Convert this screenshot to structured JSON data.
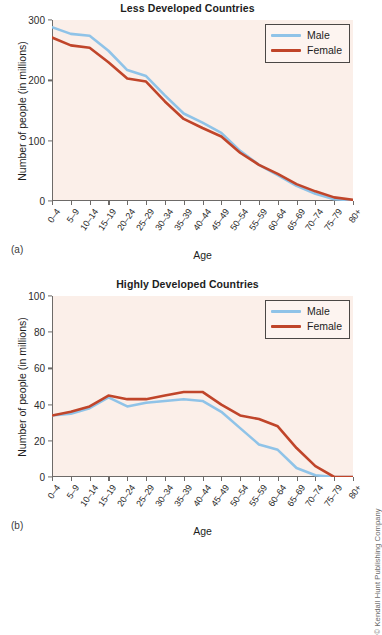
{
  "figures": [
    {
      "panel_label": "(a)",
      "title": "Less Developed Countries",
      "ylabel": "Number of people (in millions)",
      "xlabel": "Age",
      "legend": [
        {
          "label": "Male",
          "color": "#8fc3e8"
        },
        {
          "label": "Female",
          "color": "#c0452a"
        }
      ]
    },
    {
      "panel_label": "(b)",
      "title": "Highly Developed Countries",
      "ylabel": "Number of people (in millions)",
      "xlabel": "Age",
      "legend": [
        {
          "label": "Male",
          "color": "#8fc3e8"
        },
        {
          "label": "Female",
          "color": "#c0452a"
        }
      ]
    }
  ],
  "copyright": "© Kendall Hunt Publishing Company",
  "colors": {
    "male": "#8fc3e8",
    "female": "#c0452a",
    "plot_background": "#fbefe9",
    "axis": "#6d6a68",
    "page_background": "#ffffff"
  },
  "chart_data": [
    {
      "type": "line",
      "title": "Less Developed Countries",
      "panel": "(a)",
      "xlabel": "Age",
      "ylabel": "Number of people (in millions)",
      "categories": [
        "0-4",
        "5-9",
        "10-14",
        "15-19",
        "20-24",
        "25-29",
        "30-34",
        "35-39",
        "40-44",
        "45-49",
        "50-54",
        "55-59",
        "60-64",
        "65-69",
        "70-74",
        "75-79",
        "80+"
      ],
      "ylim": [
        0,
        300
      ],
      "yticks": [
        0,
        100,
        200,
        300
      ],
      "grid": false,
      "legend_position": "top-right",
      "series": [
        {
          "name": "Male",
          "color": "#8fc3e8",
          "values": [
            288,
            277,
            274,
            249,
            217,
            207,
            175,
            145,
            130,
            113,
            83,
            60,
            43,
            25,
            12,
            3,
            1
          ]
        },
        {
          "name": "Female",
          "color": "#c0452a",
          "values": [
            271,
            258,
            254,
            230,
            203,
            198,
            165,
            136,
            121,
            107,
            80,
            60,
            45,
            28,
            16,
            6,
            2
          ]
        }
      ]
    },
    {
      "type": "line",
      "title": "Highly Developed Countries",
      "panel": "(b)",
      "xlabel": "Age",
      "ylabel": "Number of people (in millions)",
      "categories": [
        "0-4",
        "5-9",
        "10-14",
        "15-19",
        "20-24",
        "25-29",
        "30-34",
        "35-39",
        "40-44",
        "45-49",
        "50-54",
        "55-59",
        "60-64",
        "65-69",
        "70-74",
        "75-79",
        "80+"
      ],
      "ylim": [
        0,
        100
      ],
      "yticks": [
        0,
        20,
        40,
        60,
        80,
        100
      ],
      "grid": false,
      "legend_position": "top-right",
      "series": [
        {
          "name": "Male",
          "color": "#8fc3e8",
          "values": [
            34,
            35,
            38,
            44,
            39,
            41,
            42,
            43,
            42,
            36,
            27,
            18,
            15,
            5,
            1,
            0,
            0
          ]
        },
        {
          "name": "Female",
          "color": "#c0452a",
          "values": [
            34,
            36,
            39,
            45,
            43,
            43,
            45,
            47,
            47,
            40,
            34,
            32,
            28,
            16,
            6,
            0,
            0
          ]
        }
      ]
    }
  ]
}
